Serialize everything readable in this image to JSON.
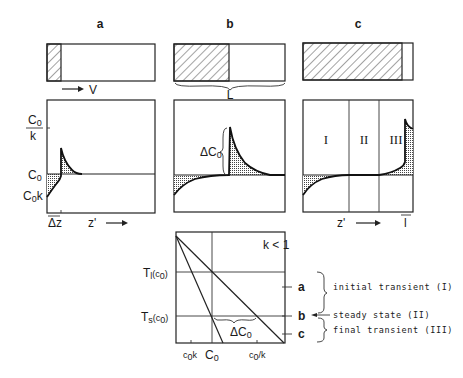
{
  "columns": {
    "a": {
      "header": "a",
      "solid_fraction": 0.13
    },
    "b": {
      "header": "b",
      "solid_fraction": 0.5
    },
    "c": {
      "header": "c",
      "solid_fraction": 0.9
    }
  },
  "labels": {
    "velocity": "V",
    "length": "L",
    "c0_over_k_num": "C",
    "c0_over_k_sub": "0",
    "c0_over_k_den": "k",
    "c0": "C",
    "c0_sub": "0",
    "c0k": "C",
    "c0k_sub": "0",
    "c0k_k": "k",
    "delta_z": "Δz",
    "z_prime_a": "z'",
    "z_prime_c": "z'",
    "delta_c0_b": "ΔC",
    "delta_c0_b_sub": "0",
    "region_1": "I",
    "region_2": "II",
    "region_3": "III",
    "small_l": "l"
  },
  "phase_diagram": {
    "condition": "k < 1",
    "tl_label": "T",
    "tl_sub": "l",
    "tl_arg": "(c",
    "tl_arg_sub": "0",
    "tl_close": ")",
    "ts_label": "T",
    "ts_sub": "s",
    "ts_arg": "(c",
    "ts_arg_sub": "0",
    "ts_close": ")",
    "delta_c0": "ΔC",
    "delta_c0_sub": "0",
    "x_ticks": {
      "c0k": "c",
      "c0k_sub": "0",
      "c0k_k": "k",
      "c0": "C",
      "c0_sub": "0",
      "c0_over_k": "c",
      "c0_over_k_sub": "0",
      "c0_over_k_k": "/k"
    },
    "stage_marks": [
      "a",
      "b",
      "c"
    ]
  },
  "legend": {
    "initial": "initial transient (I)",
    "steady": "steady state (II)",
    "final": "final transient (III)"
  }
}
